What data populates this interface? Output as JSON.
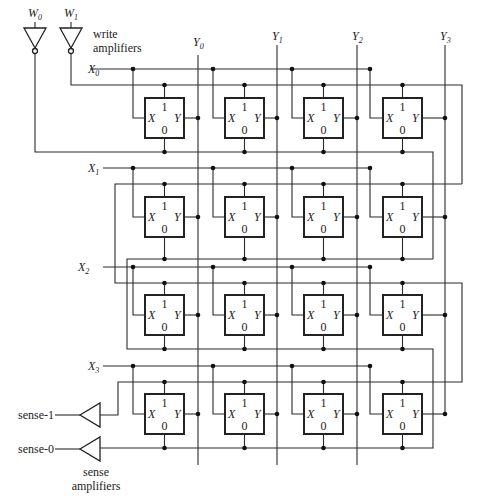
{
  "figure": {
    "write_amplifiers": {
      "label_line1": "write",
      "label_line2": "amplifiers",
      "inputs": [
        {
          "name": "W",
          "sub": "0"
        },
        {
          "name": "W",
          "sub": "1"
        }
      ]
    },
    "sense_amplifiers": {
      "label_line1": "sense",
      "label_line2": "amplifiers",
      "outputs": [
        "sense-1",
        "sense-0"
      ]
    },
    "row_lines": [
      {
        "name": "X",
        "sub": "0"
      },
      {
        "name": "X",
        "sub": "1"
      },
      {
        "name": "X",
        "sub": "2"
      },
      {
        "name": "X",
        "sub": "3"
      }
    ],
    "column_lines": [
      {
        "name": "Y",
        "sub": "0"
      },
      {
        "name": "Y",
        "sub": "1"
      },
      {
        "name": "Y",
        "sub": "2"
      },
      {
        "name": "Y",
        "sub": "3"
      }
    ],
    "cell": {
      "top_pin": "1",
      "bottom_pin": "0",
      "left_pin": "X",
      "right_pin": "Y"
    },
    "rows": 4,
    "cols": 4
  }
}
